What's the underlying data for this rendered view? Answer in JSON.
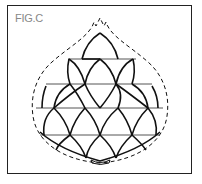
{
  "figure": {
    "label": "FIG.C",
    "line_color": "#111111",
    "label_color": "#888888"
  }
}
